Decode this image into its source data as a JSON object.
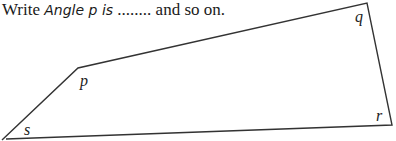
{
  "instruction": {
    "prefix": "Write ",
    "code": "Angle p is",
    "suffix": " ........ and so on."
  },
  "figure": {
    "shape": "quadrilateral",
    "stroke_color": "#333333",
    "vertices": [
      {
        "name": "s",
        "label": "s"
      },
      {
        "name": "p",
        "label": "p"
      },
      {
        "name": "q",
        "label": "q"
      },
      {
        "name": "r",
        "label": "r"
      }
    ]
  }
}
